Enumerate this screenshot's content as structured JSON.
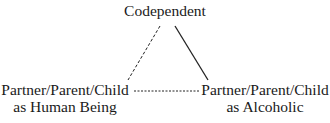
{
  "diagram": {
    "nodes": {
      "top": {
        "label": "Codependent"
      },
      "left": {
        "line1": "Partner/Parent/Child",
        "line2": "as Human Being"
      },
      "right": {
        "line1": "Partner/Parent/Child",
        "line2": "as Alcoholic"
      }
    },
    "edges": [
      {
        "from": "top",
        "to": "left",
        "style": "dashed"
      },
      {
        "from": "top",
        "to": "right",
        "style": "solid"
      },
      {
        "from": "left",
        "to": "right",
        "style": "dashed"
      }
    ]
  }
}
